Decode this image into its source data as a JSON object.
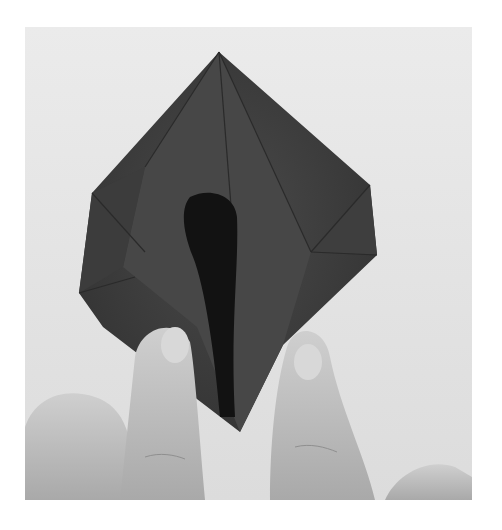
{
  "image": {
    "alt": "Hands folding a dark origami paper model (petal/preliminary base being opened)",
    "subject": "origami-folding-step",
    "palette": {
      "background": "#e6e6e6",
      "paper_dark": "#3a3a3a",
      "paper_mid": "#4e4e4e",
      "paper_shadow": "#141414",
      "skin_light": "#c9c9c9",
      "skin_mid": "#a8a8a8",
      "page": "#ffffff"
    }
  }
}
